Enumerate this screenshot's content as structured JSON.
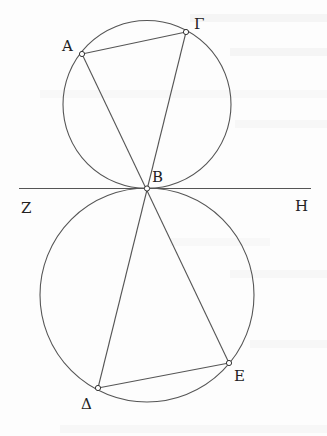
{
  "diagram": {
    "type": "geometry",
    "colors": {
      "stroke": "#555555",
      "label": "#222222",
      "background": "#fdfdfd",
      "point_fill": "#ffffff"
    },
    "circles": [
      {
        "id": "upper",
        "cx": 147,
        "cy": 104.5,
        "r": 84
      },
      {
        "id": "lower",
        "cx": 147,
        "cy": 295,
        "r": 107
      }
    ],
    "tangent_line": {
      "x1": 19,
      "y1": 188.5,
      "x2": 311,
      "y2": 188.5
    },
    "points": {
      "A": {
        "x": 82,
        "y": 54,
        "label": "A",
        "lx": 62,
        "ly": 51
      },
      "Gamma": {
        "x": 186,
        "y": 32,
        "label": "Γ",
        "lx": 194,
        "ly": 29
      },
      "B": {
        "x": 147,
        "y": 188.5,
        "label": "B",
        "lx": 152,
        "ly": 182
      },
      "Delta": {
        "x": 98,
        "y": 388,
        "label": "Δ",
        "lx": 81,
        "ly": 409
      },
      "E": {
        "x": 229,
        "y": 363,
        "label": "E",
        "lx": 234,
        "ly": 381
      }
    },
    "line_labels": {
      "Z": {
        "label": "Z",
        "x": 21,
        "y": 213
      },
      "H": {
        "label": "H",
        "x": 295,
        "y": 211
      }
    },
    "segments": [
      [
        "A",
        "Gamma"
      ],
      [
        "A",
        "E"
      ],
      [
        "Gamma",
        "Delta"
      ],
      [
        "Delta",
        "E"
      ]
    ]
  }
}
